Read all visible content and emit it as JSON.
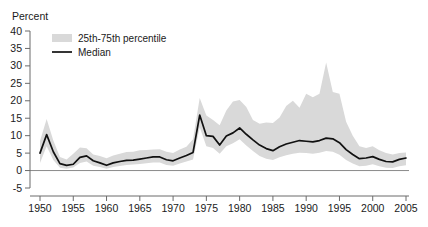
{
  "chart_data": {
    "type": "area",
    "title": "",
    "ylabel": "Percent",
    "xlabel": "",
    "ylim": [
      -5,
      40
    ],
    "xlim": [
      1949,
      2006
    ],
    "grid": false,
    "legend_position": "top-left",
    "y_ticks": [
      -5,
      0,
      5,
      10,
      15,
      20,
      25,
      30,
      35,
      40
    ],
    "y_tick_labels": [
      "-5",
      "0",
      "5",
      "10",
      "15",
      "20",
      "25",
      "30",
      "35",
      "40"
    ],
    "x_ticks": [
      1950,
      1955,
      1960,
      1965,
      1970,
      1975,
      1980,
      1985,
      1990,
      1995,
      2000,
      2005
    ],
    "x_tick_labels": [
      "1950",
      "1955",
      "1960",
      "1965",
      "1970",
      "1975",
      "1980",
      "1985",
      "1990",
      "1995",
      "2000",
      "2005"
    ],
    "legend": [
      {
        "label": "25th-75th percentile",
        "kind": "band",
        "color": "#d9d9d9"
      },
      {
        "label": "Median",
        "kind": "line",
        "color": "#111111"
      }
    ],
    "series": [
      {
        "name": "Median",
        "kind": "line",
        "color": "#111111",
        "x": [
          1950,
          1951,
          1952,
          1953,
          1954,
          1955,
          1956,
          1957,
          1958,
          1959,
          1960,
          1961,
          1962,
          1963,
          1964,
          1965,
          1966,
          1967,
          1968,
          1969,
          1970,
          1971,
          1972,
          1973,
          1974,
          1975,
          1976,
          1977,
          1978,
          1979,
          1980,
          1981,
          1982,
          1983,
          1984,
          1985,
          1986,
          1987,
          1988,
          1989,
          1990,
          1991,
          1992,
          1993,
          1994,
          1995,
          1996,
          1997,
          1998,
          1999,
          2000,
          2001,
          2002,
          2003,
          2004,
          2005
        ],
        "values": [
          5.0,
          10.3,
          5.4,
          2.0,
          1.5,
          1.8,
          3.8,
          4.2,
          2.8,
          2.2,
          1.5,
          2.2,
          2.6,
          2.9,
          3.0,
          3.3,
          3.6,
          3.9,
          3.9,
          3.1,
          2.8,
          3.6,
          4.3,
          5.2,
          15.9,
          10.0,
          9.8,
          7.3,
          9.9,
          10.8,
          12.2,
          10.4,
          8.8,
          7.3,
          6.3,
          5.7,
          6.8,
          7.6,
          8.1,
          8.6,
          8.4,
          8.2,
          8.6,
          9.3,
          9.1,
          8.0,
          6.0,
          4.6,
          3.4,
          3.6,
          4.0,
          3.2,
          2.6,
          2.5,
          3.2,
          3.6
        ]
      },
      {
        "name": "25th percentile",
        "kind": "band_lower",
        "color": "#d9d9d9",
        "x": [
          1950,
          1951,
          1952,
          1953,
          1954,
          1955,
          1956,
          1957,
          1958,
          1959,
          1960,
          1961,
          1962,
          1963,
          1964,
          1965,
          1966,
          1967,
          1968,
          1969,
          1970,
          1971,
          1972,
          1973,
          1974,
          1975,
          1976,
          1977,
          1978,
          1979,
          1980,
          1981,
          1982,
          1983,
          1984,
          1985,
          1986,
          1987,
          1988,
          1989,
          1990,
          1991,
          1992,
          1993,
          1994,
          1995,
          1996,
          1997,
          1998,
          1999,
          2000,
          2001,
          2002,
          2003,
          2004,
          2005
        ],
        "values": [
          2.2,
          7.0,
          3.0,
          0.8,
          0.5,
          0.9,
          2.2,
          2.6,
          1.4,
          1.0,
          0.5,
          1.0,
          1.3,
          1.6,
          1.7,
          1.9,
          2.1,
          2.3,
          2.3,
          1.6,
          1.4,
          2.0,
          2.6,
          3.2,
          12.4,
          7.0,
          6.5,
          4.8,
          7.0,
          7.8,
          9.0,
          7.2,
          5.6,
          4.2,
          3.4,
          3.0,
          3.8,
          4.4,
          4.8,
          5.1,
          5.0,
          4.8,
          5.1,
          5.6,
          5.4,
          4.5,
          3.0,
          2.0,
          1.2,
          1.4,
          1.8,
          1.2,
          0.8,
          0.7,
          1.2,
          1.5
        ]
      },
      {
        "name": "75th percentile",
        "kind": "band_upper",
        "color": "#d9d9d9",
        "x": [
          1950,
          1951,
          1952,
          1953,
          1954,
          1955,
          1956,
          1957,
          1958,
          1959,
          1960,
          1961,
          1962,
          1963,
          1964,
          1965,
          1966,
          1967,
          1968,
          1969,
          1970,
          1971,
          1972,
          1973,
          1974,
          1975,
          1976,
          1977,
          1978,
          1979,
          1980,
          1981,
          1982,
          1983,
          1984,
          1985,
          1986,
          1987,
          1988,
          1989,
          1990,
          1991,
          1992,
          1993,
          1994,
          1995,
          1996,
          1997,
          1998,
          1999,
          2000,
          2001,
          2002,
          2003,
          2004,
          2005
        ],
        "values": [
          8.5,
          14.8,
          8.6,
          3.9,
          3.2,
          4.8,
          6.6,
          6.4,
          4.6,
          4.2,
          3.5,
          4.3,
          4.8,
          5.3,
          5.4,
          5.8,
          5.9,
          6.0,
          6.1,
          5.4,
          5.0,
          6.0,
          6.8,
          9.0,
          20.8,
          15.8,
          14.5,
          13.0,
          17.2,
          19.8,
          20.2,
          18.2,
          14.5,
          13.4,
          13.8,
          13.6,
          15.2,
          18.5,
          20.0,
          18.0,
          22.0,
          21.0,
          22.0,
          31.0,
          22.5,
          22.0,
          14.0,
          10.0,
          7.0,
          6.5,
          7.0,
          5.8,
          5.0,
          4.6,
          5.0,
          5.2
        ]
      }
    ],
    "annotations": []
  },
  "geometry": {
    "plot_left": 40,
    "plot_right": 406,
    "y_top_px": 31,
    "y_bottom_px": 188,
    "y_top_val": 40,
    "y_bottom_val": -5
  },
  "labels": {
    "y_axis_title": "Percent"
  }
}
